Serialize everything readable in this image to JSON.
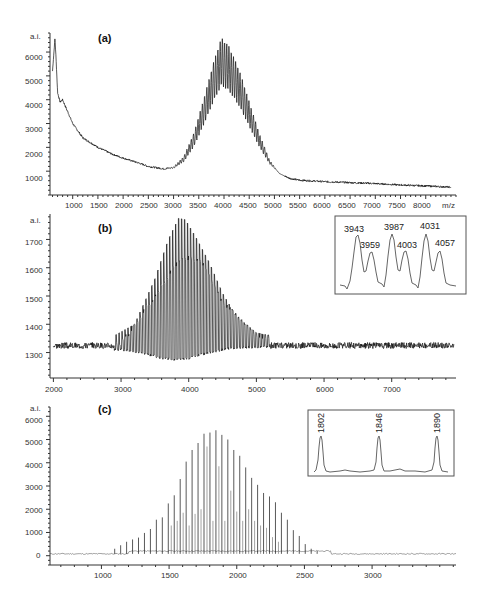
{
  "chart_data": [
    {
      "panel": "(a)",
      "type": "line",
      "title": "(a)",
      "xlabel": "m/z",
      "ylabel": "a.i.",
      "xlim": [
        550,
        8600
      ],
      "ylim": [
        0,
        6800
      ],
      "x_ticks": [
        1000,
        1500,
        2000,
        2500,
        3000,
        3500,
        4000,
        4500,
        5000,
        5500,
        6000,
        6500,
        7000,
        7500,
        8000
      ],
      "y_ticks": [
        1000,
        2000,
        3000,
        4000,
        5000,
        6000
      ],
      "grid": false,
      "series": [
        {
          "name": "spectrum-envelope",
          "x": [
            600,
            650,
            700,
            750,
            800,
            900,
            1000,
            1200,
            1500,
            1800,
            2000,
            2300,
            2500,
            2800,
            3000,
            3200,
            3400,
            3600,
            3800,
            3950,
            4000,
            4100,
            4300,
            4500,
            4700,
            4900,
            5100,
            5300,
            5500,
            6000,
            6500,
            7000,
            7500,
            8000,
            8500
          ],
          "y": [
            5200,
            6600,
            4300,
            3900,
            4000,
            3500,
            3000,
            2400,
            2000,
            1700,
            1550,
            1350,
            1200,
            1100,
            1150,
            1500,
            2300,
            3500,
            4800,
            5600,
            5500,
            5300,
            4500,
            3400,
            2300,
            1400,
            900,
            700,
            620,
            560,
            520,
            480,
            420,
            380,
            330
          ]
        }
      ],
      "peak_modulation_top": 6650,
      "peak_center_mz": 4000
    },
    {
      "panel": "(b)",
      "type": "line",
      "title": "(b)",
      "xlabel": "",
      "ylabel": "a.i.",
      "xlim": [
        1950,
        7950
      ],
      "ylim": [
        1210,
        1790
      ],
      "x_ticks": [
        2000,
        3000,
        4000,
        5000,
        6000,
        7000
      ],
      "y_ticks": [
        1300,
        1400,
        1500,
        1600,
        1700
      ],
      "grid": false,
      "series": [
        {
          "name": "upper-envelope",
          "x": [
            2000,
            2500,
            2900,
            3200,
            3500,
            3700,
            3850,
            3950,
            4100,
            4300,
            4500,
            4700,
            5000,
            5500,
            6000,
            7000,
            7900
          ],
          "y": [
            1345,
            1340,
            1360,
            1400,
            1560,
            1700,
            1775,
            1770,
            1710,
            1620,
            1510,
            1430,
            1370,
            1345,
            1340,
            1345,
            1340
          ]
        },
        {
          "name": "mid-envelope",
          "x": [
            2000,
            3000,
            3500,
            3800,
            4000,
            4200,
            4500,
            5000,
            6000,
            7900
          ],
          "y": [
            1325,
            1330,
            1500,
            1610,
            1635,
            1620,
            1480,
            1360,
            1330,
            1325
          ]
        },
        {
          "name": "lower-envelope",
          "x": [
            2000,
            3000,
            3300,
            3600,
            3800,
            4000,
            4300,
            4600,
            5000,
            6000,
            7900
          ],
          "y": [
            1320,
            1310,
            1300,
            1280,
            1275,
            1280,
            1300,
            1315,
            1320,
            1320,
            1320
          ]
        }
      ],
      "inset": {
        "peak_labels": [
          "3943",
          "3959",
          "3987",
          "4003",
          "4031",
          "4057"
        ],
        "peak_heights_relative": [
          1.0,
          0.68,
          1.0,
          0.72,
          1.0,
          0.72
        ]
      }
    },
    {
      "panel": "(c)",
      "type": "bar",
      "title": "(c)",
      "xlabel": "",
      "ylabel": "a.i.",
      "xlim": [
        620,
        3620
      ],
      "ylim": [
        -400,
        6400
      ],
      "x_ticks": [
        1000,
        1500,
        2000,
        2500,
        3000
      ],
      "y_ticks": [
        0,
        1000,
        2000,
        3000,
        4000,
        5000,
        6000
      ],
      "grid": false,
      "series": [
        {
          "name": "main-peaks",
          "x": [
            1054,
            1098,
            1142,
            1186,
            1230,
            1274,
            1318,
            1362,
            1406,
            1450,
            1494,
            1538,
            1582,
            1626,
            1670,
            1714,
            1758,
            1802,
            1846,
            1890,
            1934,
            1978,
            2022,
            2066,
            2110,
            2154,
            2198,
            2242,
            2286,
            2330,
            2374,
            2418,
            2462,
            2506,
            2550,
            2594
          ],
          "y": [
            80,
            300,
            450,
            600,
            700,
            780,
            980,
            1150,
            1550,
            1650,
            2250,
            2600,
            3300,
            4050,
            4550,
            4850,
            5250,
            5300,
            5400,
            5200,
            5000,
            4550,
            4300,
            3800,
            3350,
            3050,
            2700,
            2550,
            2300,
            1850,
            1550,
            1100,
            850,
            500,
            300,
            200
          ]
        },
        {
          "name": "satellite-peaks",
          "x": [
            1516,
            1560,
            1604,
            1648,
            1692,
            1736,
            1780,
            1824,
            1868,
            1912,
            1956,
            2000,
            2044,
            2088,
            2132,
            2176,
            2220,
            2264,
            2308
          ],
          "y": [
            1300,
            1500,
            1850,
            1300,
            1800,
            2000,
            4700,
            1500,
            3850,
            1500,
            2800,
            1900,
            1500,
            2000,
            1500,
            1300,
            1200,
            800,
            600
          ]
        }
      ],
      "inset": {
        "peak_labels": [
          "1802",
          "1846",
          "1890"
        ],
        "peak_heights_relative": [
          1.0,
          1.0,
          1.0
        ]
      }
    }
  ],
  "panels": {
    "a": {
      "label": "(a)",
      "ylabel": "a.i.",
      "xunit": "m/z",
      "y_ticks": [
        "6000",
        "5000",
        "4000",
        "3000",
        "2000",
        "1000"
      ],
      "x_ticks": [
        "1000",
        "1500",
        "2000",
        "2500",
        "3000",
        "3500",
        "4000",
        "4500",
        "5000",
        "5500",
        "6000",
        "6500",
        "7000",
        "7500",
        "8000"
      ]
    },
    "b": {
      "label": "(b)",
      "ylabel": "a.i.",
      "y_ticks": [
        "1700",
        "1600",
        "1500",
        "1400",
        "1300"
      ],
      "x_ticks": [
        "2000",
        "3000",
        "4000",
        "5000",
        "6000",
        "7000"
      ],
      "inset_labels": [
        "3943",
        "3959",
        "3987",
        "4003",
        "4031",
        "4057"
      ]
    },
    "c": {
      "label": "(c)",
      "ylabel": "a.i.",
      "y_ticks": [
        "6000",
        "5000",
        "4000",
        "3000",
        "2000",
        "1000",
        "0"
      ],
      "x_ticks": [
        "1000",
        "1500",
        "2000",
        "2500",
        "3000"
      ],
      "inset_labels": [
        "1802",
        "1846",
        "1890"
      ]
    }
  }
}
